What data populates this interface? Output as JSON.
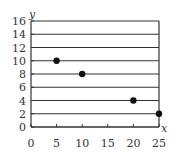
{
  "chart_data": {
    "type": "scatter",
    "title": "",
    "xlabel": "x",
    "ylabel": "y",
    "xlim": [
      0,
      25
    ],
    "ylim": [
      0,
      16
    ],
    "x_ticks": [
      0,
      5,
      10,
      15,
      20,
      25
    ],
    "y_ticks": [
      0,
      2,
      4,
      6,
      8,
      10,
      12,
      14,
      16
    ],
    "grid": {
      "horizontal": true,
      "vertical": false
    },
    "legend": null,
    "series": [
      {
        "name": "points",
        "x": [
          5,
          10,
          20,
          25
        ],
        "y": [
          10,
          8,
          4,
          2
        ]
      }
    ]
  },
  "labels": {
    "x_axis": "x",
    "y_axis": "y",
    "x_ticks": [
      "0",
      "5",
      "10",
      "15",
      "20",
      "25"
    ],
    "y_ticks": [
      "0",
      "2",
      "4",
      "6",
      "8",
      "10",
      "12",
      "14",
      "16"
    ]
  },
  "colors": {
    "axis": "#333333",
    "grid": "#333333",
    "point": "#111111"
  }
}
